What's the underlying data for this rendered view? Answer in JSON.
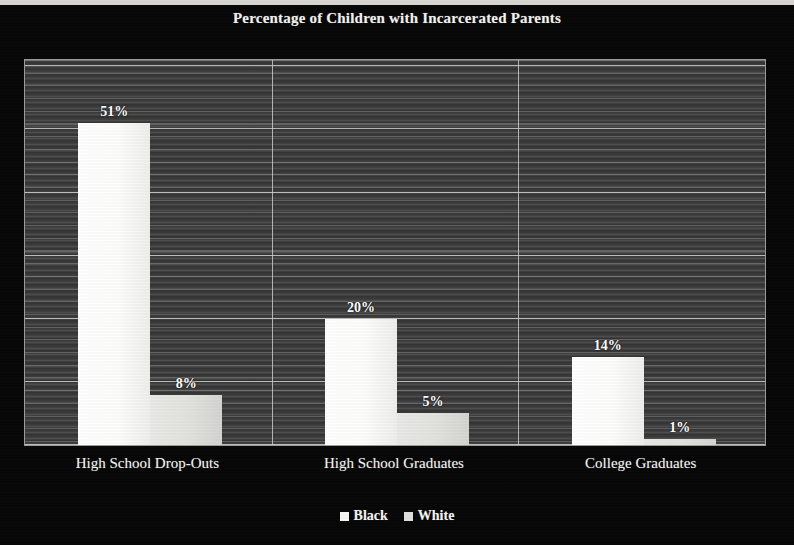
{
  "chart_data": {
    "type": "bar",
    "title": "Percentage of Children with Incarcerated Parents",
    "xlabel": "",
    "ylabel": "",
    "ylim": [
      0,
      61
    ],
    "grid": true,
    "legend_position": "bottom",
    "categories": [
      "High School Drop-Outs",
      "High School Graduates",
      "College Graduates"
    ],
    "series": [
      {
        "name": "Black",
        "values": [
          51,
          20,
          14
        ],
        "value_labels": [
          "51%",
          "20%",
          "14%"
        ],
        "color": "#fbfbfa"
      },
      {
        "name": "White",
        "values": [
          8,
          5,
          1
        ],
        "value_labels": [
          "8%",
          "5%",
          "1%"
        ],
        "color": "#e2e2df"
      }
    ],
    "plot_background": "#3b3b3b",
    "figure_background": "#070707",
    "text_color": "#f4f4f2"
  },
  "figure": {
    "title": "Percentage of Children with Incarcerated Parents"
  },
  "axis": {
    "categories": [
      {
        "label": "High School Drop-Outs"
      },
      {
        "label": "High School Graduates"
      },
      {
        "label": "College Graduates"
      }
    ]
  },
  "legend": {
    "items": [
      {
        "label": "Black"
      },
      {
        "label": "White"
      }
    ]
  },
  "bars": [
    {
      "group": "High School Drop-Outs",
      "series": "Black",
      "value": 51,
      "label": "51%"
    },
    {
      "group": "High School Drop-Outs",
      "series": "White",
      "value": 8,
      "label": "8%"
    },
    {
      "group": "High School Graduates",
      "series": "Black",
      "value": 20,
      "label": "20%"
    },
    {
      "group": "High School Graduates",
      "series": "White",
      "value": 5,
      "label": "5%"
    },
    {
      "group": "College Graduates",
      "series": "Black",
      "value": 14,
      "label": "14%"
    },
    {
      "group": "College Graduates",
      "series": "White",
      "value": 1,
      "label": "1%"
    }
  ]
}
